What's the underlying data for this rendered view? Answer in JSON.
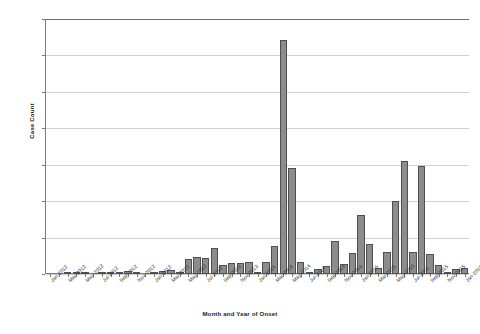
{
  "chart_data": {
    "type": "bar",
    "title": "",
    "xlabel": "Month and Year of Onset",
    "ylabel": "Case Count",
    "ylim": [
      0,
      350
    ],
    "ytick_step": 50,
    "yticks": [
      0,
      50,
      100,
      150,
      200,
      250,
      300,
      350
    ],
    "grid": true,
    "legend": null,
    "bar_color": "#8c8c8c",
    "bar_edge_color": "#4f4f4f",
    "categories": [
      "Jan-2012",
      "Feb-2012",
      "Mar-2012",
      "Apr-2012",
      "May-2012",
      "Jun-2012",
      "Jul-2012",
      "Aug-2012",
      "Sep-2012",
      "Oct-2012",
      "Nov-2012",
      "Dec-2012",
      "Jan-2013",
      "Feb-2013",
      "Mar-2013",
      "Apr-2013",
      "May-2013",
      "Jun-2013",
      "Jul-2013",
      "Aug-2013",
      "Sep-2013",
      "Oct-2013",
      "Nov-2013",
      "Dec-2013",
      "Jan-2014",
      "Feb-2014",
      "Mar-2014",
      "Apr-2014",
      "May-2014",
      "Jun-2014",
      "Jul-2014",
      "Aug-2014",
      "Sep-2014",
      "Oct-2014",
      "Nov-2014",
      "Dec-2014",
      "Jan-2015",
      "Feb-2015",
      "Mar-2015",
      "Apr-2015",
      "May-2015",
      "Jun-2015",
      "Jul-2015",
      "Aug-2015",
      "Sep-2015",
      "Oct-2015",
      "Nov-2015",
      "Dec-2015",
      "Jan-2016"
    ],
    "values": [
      0,
      0,
      3,
      1,
      1,
      0,
      1,
      1,
      2,
      4,
      2,
      0,
      1,
      4,
      6,
      2,
      21,
      24,
      22,
      36,
      13,
      15,
      15,
      16,
      3,
      16,
      39,
      321,
      145,
      16,
      3,
      7,
      11,
      45,
      14,
      29,
      81,
      41,
      8,
      30,
      100,
      155,
      30,
      148,
      27,
      12,
      2,
      7,
      8
    ],
    "xtick_labels": [
      {
        "index": 0,
        "label": "Jan-2012"
      },
      {
        "index": 2,
        "label": "Mar-2012"
      },
      {
        "index": 4,
        "label": "May-2012"
      },
      {
        "index": 6,
        "label": "Jul-2012"
      },
      {
        "index": 8,
        "label": "Sep-2012"
      },
      {
        "index": 10,
        "label": "Nov-2012"
      },
      {
        "index": 12,
        "label": "Jan-2013"
      },
      {
        "index": 14,
        "label": "Mar-2013"
      },
      {
        "index": 16,
        "label": "May-2013"
      },
      {
        "index": 18,
        "label": "Jul-2013"
      },
      {
        "index": 20,
        "label": "Sep-2013"
      },
      {
        "index": 22,
        "label": "Nov-2013"
      },
      {
        "index": 24,
        "label": "Jan-2014"
      },
      {
        "index": 26,
        "label": "Mar-2014"
      },
      {
        "index": 28,
        "label": "May-2014"
      },
      {
        "index": 30,
        "label": "Jul-2014"
      },
      {
        "index": 32,
        "label": "Sep-2014"
      },
      {
        "index": 34,
        "label": "Nov-2014"
      },
      {
        "index": 36,
        "label": "Jan-2015"
      },
      {
        "index": 38,
        "label": "Mar-2015"
      },
      {
        "index": 40,
        "label": "May-2015"
      },
      {
        "index": 42,
        "label": "Jul-2015"
      },
      {
        "index": 44,
        "label": "Sep-2015"
      },
      {
        "index": 46,
        "label": "Nov-2015"
      },
      {
        "index": 48,
        "label": "Jan-2016"
      }
    ]
  }
}
